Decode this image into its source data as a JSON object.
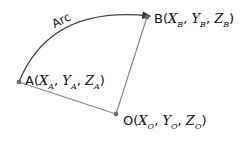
{
  "diagram": {
    "arc_label": "Arc",
    "points": [
      {
        "name": "A",
        "x": "X",
        "y": "Y",
        "z": "Z",
        "sub": "A"
      },
      {
        "name": "B",
        "x": "X",
        "y": "Y",
        "z": "Z",
        "sub": "B"
      },
      {
        "name": "O",
        "x": "X",
        "y": "Y",
        "z": "Z",
        "sub": "O"
      }
    ],
    "colors": {
      "line": "#777777",
      "arc": "#333333",
      "point": "#666666"
    }
  }
}
